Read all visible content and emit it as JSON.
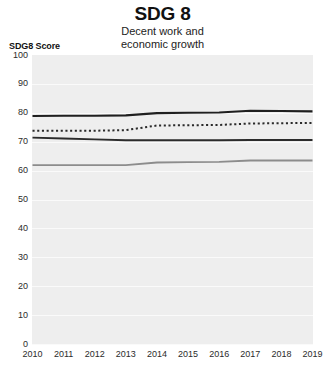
{
  "header": {
    "title": "SDG 8",
    "subtitle_line1": "Decent work and",
    "subtitle_line2": "economic growth"
  },
  "axis": {
    "y_caption": "SDG8 Score"
  },
  "chart_data": {
    "type": "line",
    "title": "SDG 8",
    "subtitle": "Decent work and economic growth",
    "xlabel": "",
    "ylabel": "SDG8 Score",
    "ylim": [
      0,
      100
    ],
    "ytick_labels": [
      "100",
      "90",
      "80",
      "70",
      "60",
      "50",
      "40",
      "30",
      "20",
      "10",
      "0"
    ],
    "yticks": [
      100,
      90,
      80,
      70,
      60,
      50,
      40,
      30,
      20,
      10,
      0
    ],
    "grid": true,
    "legend": "none",
    "x": [
      2010,
      2011,
      2012,
      2013,
      2014,
      2015,
      2016,
      2017,
      2018,
      2019
    ],
    "xtick_labels": [
      "2010",
      "2011",
      "2012",
      "2013",
      "2014",
      "2015",
      "2016",
      "2017",
      "2018",
      "2019"
    ],
    "series": [
      {
        "name": "series-top-solid-dark",
        "style": "solid",
        "color": "#1f1f1f",
        "width": 2.1,
        "values": [
          78.9,
          79.0,
          79.0,
          79.1,
          79.9,
          80.0,
          80.1,
          80.7,
          80.6,
          80.5
        ]
      },
      {
        "name": "series-dotted-dark",
        "style": "dotted",
        "color": "#2a2a2a",
        "width": 2.0,
        "values": [
          73.8,
          73.8,
          73.8,
          74.0,
          75.6,
          75.7,
          75.8,
          76.3,
          76.4,
          76.5
        ]
      },
      {
        "name": "series-middle-solid-dark",
        "style": "solid",
        "color": "#2b2b2b",
        "width": 1.9,
        "values": [
          71.4,
          71.1,
          70.8,
          70.5,
          70.5,
          70.5,
          70.5,
          70.6,
          70.6,
          70.6
        ]
      },
      {
        "name": "series-bottom-solid-gray",
        "style": "solid",
        "color": "#8c8c8c",
        "width": 1.8,
        "values": [
          61.9,
          61.9,
          61.9,
          61.9,
          62.8,
          62.9,
          63.0,
          63.5,
          63.5,
          63.5
        ]
      }
    ]
  }
}
